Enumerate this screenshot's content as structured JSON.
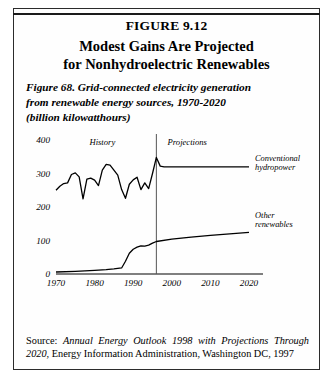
{
  "figure": {
    "number_label": "FIGURE 9.12",
    "headline_line1": "Modest Gains Are Projected",
    "headline_line2": "for Nonhydroelectric Renewables",
    "subtitle_line1": "Figure 68. Grid-connected electricity generation",
    "subtitle_line2": "from renewable energy sources, 1970-2020",
    "subtitle_line3": "(billion kilowatthours)",
    "source_prefix": "Source: ",
    "source_italic1": "Annual Energy Outlook 1998 with Projections",
    "source_italic2": "Through 2020",
    "source_rest": ", Energy Information Administration, Washington DC, 1997",
    "border_color": "#2b2b2b",
    "line_color": "#000000"
  },
  "chart_data": {
    "type": "line",
    "title": "Figure 68. Grid-connected electricity generation from renewable energy sources, 1970-2020",
    "xlabel": "",
    "ylabel": "billion kilowatthours",
    "xlim": [
      1970,
      2020
    ],
    "ylim": [
      0,
      400
    ],
    "grid": false,
    "legend_position": "right-inline",
    "xticks": [
      "1970",
      "1980",
      "1990",
      "2000",
      "2010",
      "2020"
    ],
    "xtick_values": [
      1970,
      1980,
      1990,
      2000,
      2010,
      2020
    ],
    "yticks": [
      "0",
      "100",
      "200",
      "300",
      "400"
    ],
    "ytick_values": [
      0,
      100,
      200,
      300,
      400
    ],
    "annotations": [
      {
        "text": "History",
        "x": 1982,
        "y": 385
      },
      {
        "text": "Projections",
        "x": 2004,
        "y": 385
      }
    ],
    "projection_divider_year": 1996,
    "series": [
      {
        "name": "Conventional hydropower",
        "label_line1": "Conventional",
        "label_line2": "hydropower",
        "x": [
          1970,
          1971,
          1972,
          1973,
          1974,
          1975,
          1976,
          1977,
          1978,
          1979,
          1980,
          1981,
          1982,
          1983,
          1984,
          1985,
          1986,
          1987,
          1988,
          1989,
          1990,
          1991,
          1992,
          1993,
          1994,
          1995,
          1996,
          1997,
          1998,
          2000,
          2005,
          2010,
          2015,
          2020
        ],
        "values": [
          250,
          262,
          270,
          272,
          297,
          302,
          290,
          224,
          283,
          286,
          280,
          264,
          310,
          327,
          325,
          310,
          295,
          252,
          226,
          268,
          281,
          289,
          252,
          272,
          255,
          300,
          348,
          322,
          320,
          320,
          320,
          320,
          320,
          320
        ]
      },
      {
        "name": "Other renewables",
        "label_line1": "Other",
        "label_line2": "renewables",
        "x": [
          1970,
          1975,
          1980,
          1983,
          1985,
          1987,
          1988,
          1989,
          1990,
          1991,
          1992,
          1993,
          1994,
          1995,
          1996,
          2000,
          2005,
          2010,
          2015,
          2020
        ],
        "values": [
          6,
          8,
          11,
          13,
          15,
          18,
          38,
          62,
          74,
          80,
          84,
          83,
          86,
          92,
          97,
          104,
          110,
          115,
          120,
          124
        ]
      }
    ]
  }
}
